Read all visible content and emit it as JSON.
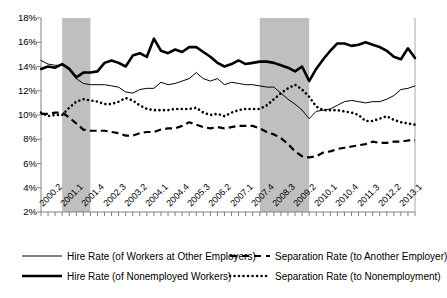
{
  "chart_data": {
    "type": "line",
    "title": "",
    "subtitle": "",
    "xlabel": "",
    "ylabel": "",
    "ylim": [
      2,
      18
    ],
    "y_ticks": [
      "2%",
      "4%",
      "6%",
      "8%",
      "10%",
      "12%",
      "14%",
      "16%",
      "18%"
    ],
    "y_tick_values": [
      2,
      4,
      6,
      8,
      10,
      12,
      14,
      16,
      18
    ],
    "grid": false,
    "legend_position": "bottom",
    "x_tick_labels": [
      "2000.2",
      "2001.1",
      "2001.4",
      "2002.3",
      "2003.2",
      "2004.1",
      "2004.4",
      "2005.3",
      "2006.2",
      "2007.1",
      "2007.4",
      "2008.3",
      "2009.2",
      "2010.1",
      "2010.4",
      "2011.3",
      "2012.2",
      "2013.1"
    ],
    "x_tick_label_step": 3,
    "x_tick_count": 54,
    "x_quarters": [
      "2000.2",
      "2000.3",
      "2000.4",
      "2001.1",
      "2001.2",
      "2001.3",
      "2001.4",
      "2002.1",
      "2002.2",
      "2002.3",
      "2002.4",
      "2003.1",
      "2003.2",
      "2003.3",
      "2003.4",
      "2004.1",
      "2004.2",
      "2004.3",
      "2004.4",
      "2005.1",
      "2005.2",
      "2005.3",
      "2005.4",
      "2006.1",
      "2006.2",
      "2006.3",
      "2006.4",
      "2007.1",
      "2007.2",
      "2007.3",
      "2007.4",
      "2008.1",
      "2008.2",
      "2008.3",
      "2008.4",
      "2009.1",
      "2009.2",
      "2009.3",
      "2009.4",
      "2010.1",
      "2010.2",
      "2010.3",
      "2010.4",
      "2011.1",
      "2011.2",
      "2011.3",
      "2011.4",
      "2012.1",
      "2012.2",
      "2012.3",
      "2012.4",
      "2013.1",
      "2013.2",
      "2013.3"
    ],
    "shaded_regions": [
      {
        "name": "recession-2001",
        "start_index": 3,
        "end_index": 7,
        "color": "#bfbfbf"
      },
      {
        "name": "recession-2008",
        "start_index": 31,
        "end_index": 38,
        "color": "#bfbfbf"
      }
    ],
    "series": [
      {
        "name": "Hire Rate (of Workers at Other Employers)",
        "style": "solid-thin",
        "color": "#000000",
        "width": 1,
        "values": [
          14.5,
          14.2,
          14.1,
          14.1,
          13.9,
          13.0,
          12.6,
          12.5,
          12.5,
          12.5,
          12.4,
          12.3,
          11.9,
          11.8,
          12.1,
          12.2,
          12.2,
          12.7,
          12.5,
          12.6,
          12.8,
          13.0,
          13.5,
          13.0,
          12.8,
          13.0,
          12.5,
          12.7,
          12.6,
          12.5,
          12.5,
          12.4,
          12.3,
          12.3,
          11.8,
          11.3,
          10.9,
          10.4,
          9.7,
          10.3,
          10.4,
          10.5,
          10.8,
          11.1,
          11.2,
          11.1,
          11.0,
          11.1,
          11.1,
          11.3,
          11.6,
          12.1,
          12.2,
          12.4
        ]
      },
      {
        "name": "Hire Rate (of Nonemployed Workers)",
        "style": "solid-thick",
        "color": "#000000",
        "width": 2.6,
        "values": [
          13.8,
          14.0,
          13.9,
          14.2,
          13.8,
          13.1,
          13.5,
          13.5,
          13.6,
          14.3,
          14.5,
          14.3,
          14.0,
          14.9,
          15.1,
          14.8,
          16.3,
          15.3,
          15.1,
          15.4,
          15.2,
          15.6,
          15.6,
          15.2,
          14.8,
          14.3,
          14.0,
          14.2,
          14.5,
          14.2,
          14.3,
          14.4,
          14.4,
          14.3,
          14.1,
          13.9,
          13.6,
          14.0,
          12.8,
          13.8,
          14.6,
          15.3,
          15.9,
          15.9,
          15.7,
          15.8,
          16.0,
          15.8,
          15.6,
          15.3,
          14.8,
          14.6,
          15.5,
          14.7
        ]
      },
      {
        "name": "Separation Rate (to Another Employer)",
        "style": "dashed",
        "color": "#000000",
        "width": 2.2,
        "values": [
          10.1,
          10.1,
          10.2,
          10.2,
          9.8,
          9.3,
          8.8,
          8.7,
          8.7,
          8.7,
          8.6,
          8.5,
          8.3,
          8.3,
          8.5,
          8.6,
          8.6,
          8.8,
          8.9,
          8.9,
          9.1,
          9.4,
          9.2,
          9.0,
          8.9,
          9.0,
          8.9,
          9.0,
          9.1,
          9.1,
          9.1,
          8.9,
          8.6,
          8.4,
          8.1,
          7.6,
          7.0,
          6.6,
          6.5,
          6.6,
          6.9,
          7.0,
          7.2,
          7.3,
          7.4,
          7.5,
          7.6,
          7.8,
          7.7,
          7.7,
          7.8,
          7.8,
          7.9,
          7.9
        ]
      },
      {
        "name": "Separation Rate (to Nonemployment)",
        "style": "dotted",
        "color": "#000000",
        "width": 2.6,
        "values": [
          10.2,
          9.9,
          10.0,
          10.0,
          10.6,
          11.1,
          11.3,
          11.2,
          11.1,
          10.9,
          10.9,
          11.1,
          11.4,
          11.2,
          10.8,
          10.5,
          10.4,
          10.4,
          10.4,
          10.5,
          10.5,
          10.5,
          10.6,
          10.2,
          10.0,
          10.1,
          9.9,
          10.2,
          10.4,
          10.5,
          10.5,
          10.5,
          10.8,
          11.3,
          11.8,
          12.2,
          12.5,
          12.1,
          11.5,
          10.7,
          10.4,
          10.4,
          10.4,
          10.3,
          10.2,
          10.0,
          9.5,
          9.5,
          9.7,
          9.9,
          9.6,
          9.4,
          9.3,
          9.2
        ]
      }
    ]
  },
  "legend": {
    "items": [
      {
        "label": "Hire Rate (of Workers at Other Employers)",
        "key": "solid-thin"
      },
      {
        "label": "Separation Rate (to Another Employer)",
        "key": "dashed"
      },
      {
        "label": "Hire Rate (of Nonemployed Workers)",
        "key": "solid-thick"
      },
      {
        "label": "Separation Rate (to Nonemployment)",
        "key": "dotted"
      }
    ]
  }
}
